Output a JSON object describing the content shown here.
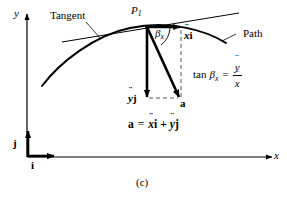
{
  "figure": {
    "caption": "(c)",
    "axes": {
      "x_label": "x",
      "y_label": "y"
    },
    "basis_vectors": {
      "i_label": "i",
      "j_label": "j"
    },
    "annotations": {
      "tangent_label": "Tangent",
      "path_label": "Path",
      "point_label": "P",
      "point_subscript": "1",
      "angle_label": "β",
      "angle_subscript": "x"
    },
    "vectors": {
      "horizontal_component": {
        "symbol": "x",
        "unit": "i",
        "notation": "double-dot"
      },
      "vertical_component": {
        "symbol": "y",
        "unit": "j",
        "notation": "double-dot"
      },
      "resultant_label": "a"
    },
    "equations": {
      "tan_lhs": "tan",
      "tan_angle": "β",
      "tan_angle_sub": "x",
      "tan_equals": "=",
      "tan_numerator": "y",
      "tan_denominator": "x",
      "accel_lhs": "a",
      "accel_equals": "=",
      "accel_term1_symbol": "x",
      "accel_term1_unit": "i",
      "accel_plus": "+",
      "accel_term2_symbol": "y",
      "accel_term2_unit": "j"
    },
    "colors": {
      "ink": "#000000",
      "background": "#ffffff",
      "dash": "#555555"
    }
  }
}
